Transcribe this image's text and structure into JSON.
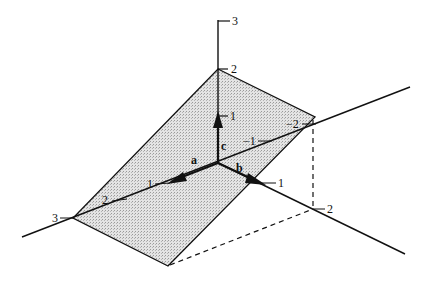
{
  "figure": {
    "vectors": {
      "a": "a",
      "b": "b",
      "c": "c"
    },
    "c_axis_ticks": [
      "1",
      "2",
      "3"
    ],
    "a_axis_ticks_positive": [
      "1",
      "2",
      "3"
    ],
    "a_axis_ticks_negative": [
      "−1",
      "−2"
    ],
    "b_axis_ticks": [
      "1",
      "2"
    ],
    "plane_fill_color": "#d9d9d9",
    "line_color": "#111111"
  }
}
